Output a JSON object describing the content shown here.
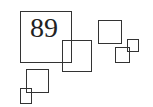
{
  "diagram": {
    "stroke_color": "#333333",
    "background": "#ffffff",
    "label": {
      "text": "89",
      "font_size": 28,
      "x": 30,
      "y": 14
    },
    "boxes": [
      {
        "id": "big-box",
        "x": 20,
        "y": 11,
        "w": 52,
        "h": 52
      },
      {
        "id": "middle-box",
        "x": 62,
        "y": 40,
        "w": 30,
        "h": 32
      },
      {
        "id": "upper-right-box",
        "x": 98,
        "y": 20,
        "w": 24,
        "h": 24
      },
      {
        "id": "small-right-box",
        "x": 115,
        "y": 47,
        "w": 15,
        "h": 16
      },
      {
        "id": "tiny-right-box",
        "x": 127,
        "y": 39,
        "w": 12,
        "h": 13
      },
      {
        "id": "lower-left-box",
        "x": 26,
        "y": 69,
        "w": 23,
        "h": 24
      },
      {
        "id": "tiny-lower-left-box",
        "x": 20,
        "y": 88,
        "w": 12,
        "h": 16
      }
    ]
  }
}
